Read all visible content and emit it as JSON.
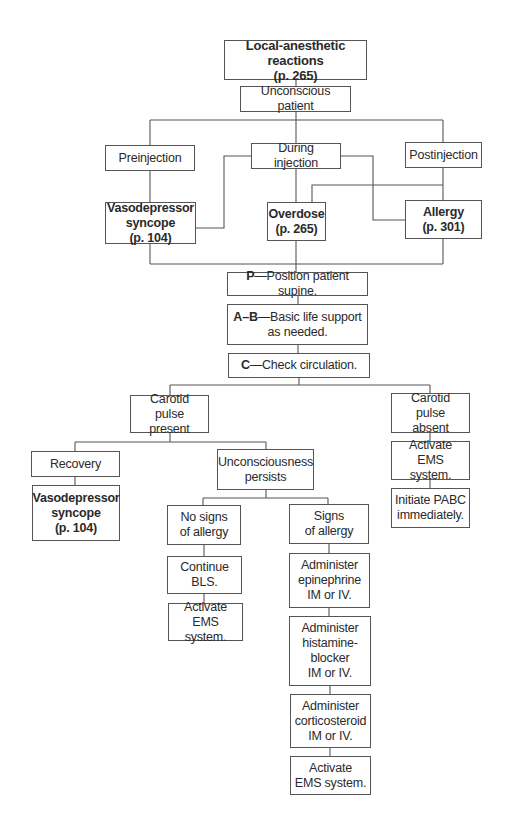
{
  "title": {
    "text": "Local-anesthetic reactions\n(p. 265)"
  },
  "nodes": {
    "unconscious": "Unconscious patient",
    "preinjection": "Preinjection",
    "during": "During injection",
    "postinjection": "Postinjection",
    "vasodepressor_top": "Vasodepressor\nsyncope\n(p. 104)",
    "overdose": "Overdose\n(p. 265)",
    "allergy": "Allergy\n(p. 301)",
    "step_p": {
      "key": "P",
      "text": "—Position patient supine."
    },
    "step_ab": {
      "key": "A–B",
      "text": "—Basic life support\nas needed."
    },
    "step_c": {
      "key": "C",
      "text": "—Check circulation."
    },
    "pulse_present": "Carotid pulse\npresent",
    "pulse_absent": "Carotid pulse\nabsent",
    "recovery": "Recovery",
    "vasodepressor_bottom": "Vasodepressor\nsyncope\n(p. 104)",
    "unconsciousness_persists": "Unconsciousness\npersists",
    "no_signs": "No signs\nof allergy",
    "signs": "Signs\nof allergy",
    "continue_bls": "Continue\nBLS.",
    "activate_ems_left": "Activate\nEMS system.",
    "epinephrine": "Administer\nepinephrine\nIM or IV.",
    "histamine": "Administer\nhistamine-\nblocker\nIM or IV.",
    "corticosteroid": "Administer\ncorticosteroid\nIM or IV.",
    "activate_ems_bottom": "Activate\nEMS system.",
    "activate_ems_right": "Activate\nEMS system.",
    "initiate_pabc": "Initiate PABC\nimmediately."
  },
  "colors": {
    "line": "#555555",
    "text": "#2a2a2a",
    "background": "#ffffff"
  }
}
